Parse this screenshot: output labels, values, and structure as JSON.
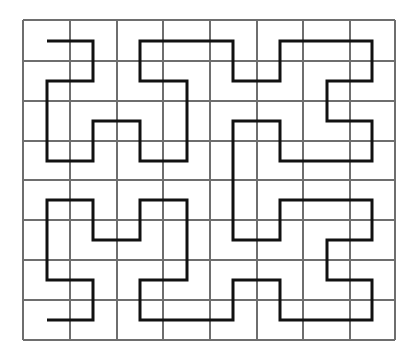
{
  "diagram": {
    "type": "hilbert-curve-on-grid",
    "grid": {
      "columns": 8,
      "rows": 8,
      "x_lines": [
        23,
        70,
        117,
        163,
        210,
        257,
        303,
        350,
        395
      ],
      "y_lines": [
        20,
        61,
        101,
        141,
        180,
        220,
        260,
        300,
        340
      ],
      "line_color": "#6e6e6e"
    },
    "path": {
      "color": "#111111",
      "stroke_width": 3,
      "cell_centers_x": [
        47,
        93,
        140,
        187,
        233,
        280,
        327,
        372
      ],
      "cell_centers_y": [
        41,
        81,
        121,
        161,
        200,
        240,
        280,
        320
      ],
      "points_cells": [
        [
          0,
          0
        ],
        [
          1,
          0
        ],
        [
          1,
          1
        ],
        [
          0,
          1
        ],
        [
          0,
          3
        ],
        [
          1,
          3
        ],
        [
          1,
          2
        ],
        [
          2,
          2
        ],
        [
          2,
          3
        ],
        [
          3,
          3
        ],
        [
          3,
          1
        ],
        [
          2,
          1
        ],
        [
          2,
          0
        ],
        [
          4,
          0
        ],
        [
          4,
          1
        ],
        [
          5,
          1
        ],
        [
          5,
          0
        ],
        [
          7,
          0
        ],
        [
          7,
          1
        ],
        [
          6,
          1
        ],
        [
          6,
          2
        ],
        [
          7,
          2
        ],
        [
          7,
          3
        ],
        [
          5,
          3
        ],
        [
          5,
          2
        ],
        [
          4,
          2
        ],
        [
          4,
          5
        ],
        [
          5,
          5
        ],
        [
          5,
          4
        ],
        [
          7,
          4
        ],
        [
          7,
          5
        ],
        [
          6,
          5
        ],
        [
          6,
          6
        ],
        [
          7,
          6
        ],
        [
          7,
          7
        ],
        [
          5,
          7
        ],
        [
          5,
          6
        ],
        [
          4,
          6
        ],
        [
          4,
          7
        ],
        [
          2,
          7
        ],
        [
          2,
          6
        ],
        [
          3,
          6
        ],
        [
          3,
          4
        ],
        [
          2,
          4
        ],
        [
          2,
          5
        ],
        [
          1,
          5
        ],
        [
          1,
          4
        ],
        [
          0,
          4
        ],
        [
          0,
          6
        ],
        [
          1,
          6
        ],
        [
          1,
          7
        ],
        [
          0,
          7
        ]
      ]
    }
  }
}
